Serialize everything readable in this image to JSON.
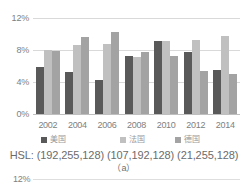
{
  "chart_data": {
    "type": "bar",
    "title": "",
    "xlabel": "",
    "ylabel": "",
    "ylim": [
      0,
      12
    ],
    "grid": true,
    "legend_position": "bottom",
    "categories": [
      "2002",
      "2004",
      "2006",
      "2008",
      "2010",
      "2012",
      "2014"
    ],
    "ytick_labels": [
      "12%",
      "8%",
      "4%",
      "0%"
    ],
    "ytick_values": [
      12,
      8,
      4,
      0
    ],
    "series": [
      {
        "name": "美国",
        "color": "#595959",
        "values": [
          5.9,
          5.3,
          4.3,
          7.2,
          9.1,
          7.8,
          5.5
        ]
      },
      {
        "name": "法国",
        "color": "#c0c0c0",
        "values": [
          8.0,
          8.6,
          8.8,
          7.1,
          9.1,
          9.2,
          9.8
        ]
      },
      {
        "name": "德国",
        "color": "#a3a3a3",
        "values": [
          7.9,
          9.6,
          10.3,
          7.8,
          7.2,
          5.4,
          5.0
        ]
      }
    ],
    "annotations": {
      "hsl_line": "HSL: (192,255,128) (107,192,128) (21,255,128)",
      "figure_label": "（a）"
    }
  },
  "next_figure": {
    "ytick_label": "12%"
  }
}
